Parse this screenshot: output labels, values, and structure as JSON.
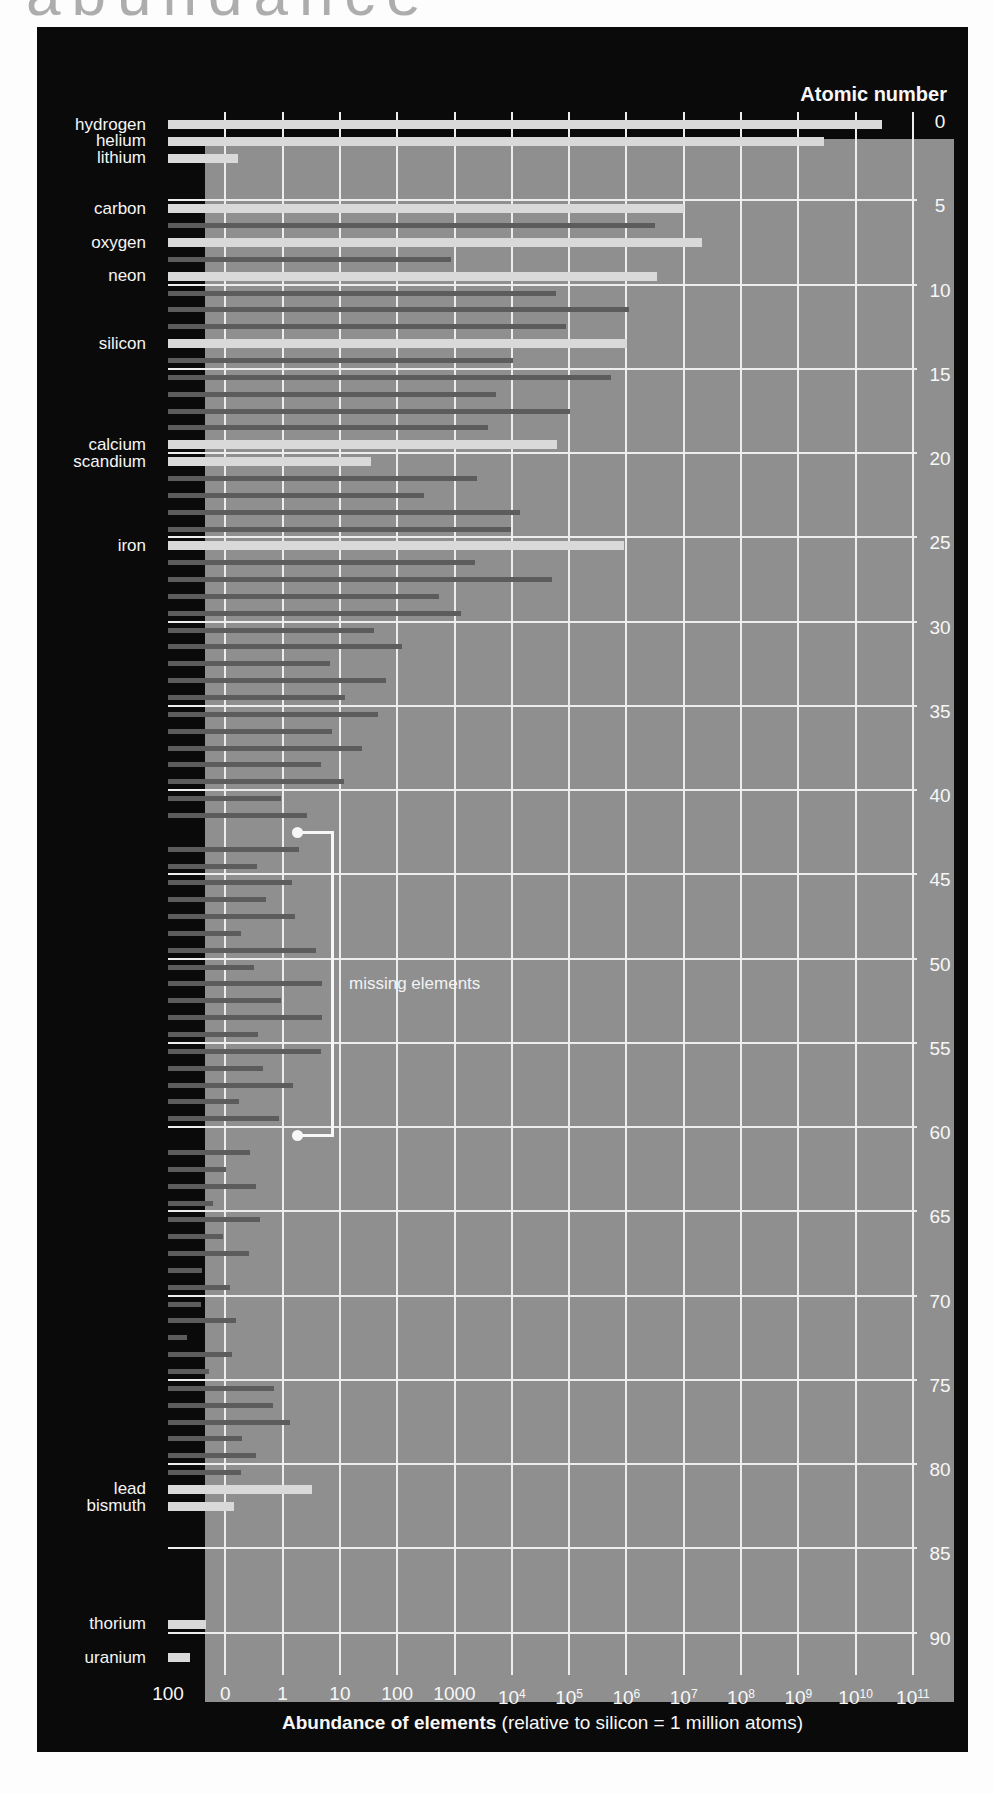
{
  "page": {
    "top_heading": "abundance"
  },
  "chart_data": {
    "type": "bar",
    "orientation": "horizontal",
    "title": "",
    "x_axis": {
      "title_bold": "Abundance of elements",
      "title_rest": " (relative to silicon = 1 million atoms)",
      "scale": "log",
      "range_decades": [
        -2,
        11
      ],
      "tick_labels": [
        {
          "t": "100"
        },
        {
          "t": "0"
        },
        {
          "t": "1"
        },
        {
          "t": "10"
        },
        {
          "t": "100"
        },
        {
          "t": "1000"
        },
        {
          "t": "10",
          "e": "4"
        },
        {
          "t": "10",
          "e": "5"
        },
        {
          "t": "10",
          "e": "6"
        },
        {
          "t": "10",
          "e": "7"
        },
        {
          "t": "10",
          "e": "8"
        },
        {
          "t": "10",
          "e": "9"
        },
        {
          "t": "10",
          "e": "10"
        },
        {
          "t": "10",
          "e": "11"
        }
      ]
    },
    "y_axis": {
      "title": "Atomic number",
      "ticks": [
        0,
        5,
        10,
        15,
        20,
        25,
        30,
        35,
        40,
        45,
        50,
        55,
        60,
        65,
        70,
        75,
        80,
        85,
        90
      ],
      "grid": true
    },
    "annotation": {
      "text": "missing elements",
      "targets_z": [
        43,
        61
      ]
    },
    "colors": {
      "panel_bg": "#0a0a0a",
      "plot_bg": "#8f8f8f",
      "gridline": "#ededed",
      "highlight_bar": "#d9d9d9",
      "dark_bar": "#5c5c5c",
      "text": "#f7f7f7",
      "page_heading": "#adadad"
    },
    "elements": [
      {
        "z": 1,
        "label": "hydrogen",
        "value": 28000000000.0,
        "hl": true
      },
      {
        "z": 2,
        "label": "helium",
        "value": 2700000000.0,
        "hl": true
      },
      {
        "z": 3,
        "label": "lithium",
        "value": 0.16,
        "hl": true
      },
      {
        "z": 4,
        "value": null
      },
      {
        "z": 5,
        "value": null
      },
      {
        "z": 6,
        "label": "carbon",
        "value": 10000000.0,
        "hl": true
      },
      {
        "z": 7,
        "value": 3100000.0
      },
      {
        "z": 8,
        "label": "oxygen",
        "value": 20000000.0,
        "hl": true
      },
      {
        "z": 9,
        "value": 850
      },
      {
        "z": 10,
        "label": "neon",
        "value": 3400000.0,
        "hl": true
      },
      {
        "z": 11,
        "value": 57000
      },
      {
        "z": 12,
        "value": 1070000
      },
      {
        "z": 13,
        "value": 85000
      },
      {
        "z": 14,
        "label": "silicon",
        "value": 1000000,
        "hl": true
      },
      {
        "z": 15,
        "value": 10400
      },
      {
        "z": 16,
        "value": 520000
      },
      {
        "z": 17,
        "value": 5240
      },
      {
        "z": 18,
        "value": 100000
      },
      {
        "z": 19,
        "value": 3770
      },
      {
        "z": 20,
        "label": "calcium",
        "value": 61000,
        "hl": true
      },
      {
        "z": 21,
        "label": "scandium",
        "value": 34,
        "hl": true
      },
      {
        "z": 22,
        "value": 2400
      },
      {
        "z": 23,
        "value": 290
      },
      {
        "z": 24,
        "value": 13500
      },
      {
        "z": 25,
        "value": 9550
      },
      {
        "z": 26,
        "label": "iron",
        "value": 900000,
        "hl": true
      },
      {
        "z": 27,
        "value": 2250
      },
      {
        "z": 28,
        "value": 49000
      },
      {
        "z": 29,
        "value": 520
      },
      {
        "z": 30,
        "value": 1260
      },
      {
        "z": 31,
        "value": 38
      },
      {
        "z": 32,
        "value": 119
      },
      {
        "z": 33,
        "value": 6.6
      },
      {
        "z": 34,
        "value": 62
      },
      {
        "z": 35,
        "value": 11.8
      },
      {
        "z": 36,
        "value": 45
      },
      {
        "z": 37,
        "value": 7.1
      },
      {
        "z": 38,
        "value": 23.5
      },
      {
        "z": 39,
        "value": 4.6
      },
      {
        "z": 40,
        "value": 11.4
      },
      {
        "z": 41,
        "value": 0.9
      },
      {
        "z": 42,
        "value": 2.6
      },
      {
        "z": 43,
        "value": null,
        "missing": true
      },
      {
        "z": 44,
        "value": 1.9
      },
      {
        "z": 45,
        "value": 0.35
      },
      {
        "z": 46,
        "value": 1.4
      },
      {
        "z": 47,
        "value": 0.5
      },
      {
        "z": 48,
        "value": 1.6
      },
      {
        "z": 49,
        "value": 0.18
      },
      {
        "z": 50,
        "value": 3.8
      },
      {
        "z": 51,
        "value": 0.31
      },
      {
        "z": 52,
        "value": 4.8
      },
      {
        "z": 53,
        "value": 0.9
      },
      {
        "z": 54,
        "value": 4.7
      },
      {
        "z": 55,
        "value": 0.37
      },
      {
        "z": 56,
        "value": 4.5
      },
      {
        "z": 57,
        "value": 0.45
      },
      {
        "z": 58,
        "value": 1.5
      },
      {
        "z": 59,
        "value": 0.17
      },
      {
        "z": 60,
        "value": 0.83
      },
      {
        "z": 61,
        "value": null,
        "missing": true
      },
      {
        "z": 62,
        "value": 0.26
      },
      {
        "z": 63,
        "value": 0.1
      },
      {
        "z": 64,
        "value": 0.33
      },
      {
        "z": 65,
        "value": 0.06
      },
      {
        "z": 66,
        "value": 0.39
      },
      {
        "z": 67,
        "value": 0.09
      },
      {
        "z": 68,
        "value": 0.25
      },
      {
        "z": 69,
        "value": 0.038
      },
      {
        "z": 70,
        "value": 0.12
      },
      {
        "z": 71,
        "value": 0.037
      },
      {
        "z": 72,
        "value": 0.15
      },
      {
        "z": 73,
        "value": 0.021
      },
      {
        "z": 74,
        "value": 0.13
      },
      {
        "z": 75,
        "value": 0.05
      },
      {
        "z": 76,
        "value": 0.68
      },
      {
        "z": 77,
        "value": 0.66
      },
      {
        "z": 78,
        "value": 1.34
      },
      {
        "z": 79,
        "value": 0.19
      },
      {
        "z": 80,
        "value": 0.34
      },
      {
        "z": 81,
        "value": 0.18
      },
      {
        "z": 82,
        "label": "lead",
        "value": 3.15,
        "hl": true
      },
      {
        "z": 83,
        "label": "bismuth",
        "value": 0.14,
        "hl": true
      },
      {
        "z": 84,
        "value": null
      },
      {
        "z": 85,
        "value": null
      },
      {
        "z": 86,
        "value": null
      },
      {
        "z": 87,
        "value": null
      },
      {
        "z": 88,
        "value": null
      },
      {
        "z": 89,
        "value": null
      },
      {
        "z": 90,
        "label": "thorium",
        "value": 0.045,
        "hl": true
      },
      {
        "z": 91,
        "value": null
      },
      {
        "z": 92,
        "label": "uranium",
        "value": 0.024,
        "hl": true
      }
    ]
  }
}
